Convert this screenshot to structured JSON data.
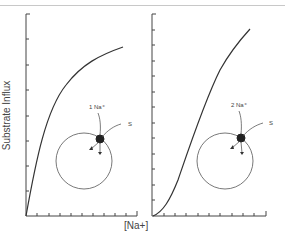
{
  "figure": {
    "ylabel": "Substrate Influx",
    "xlabel": "[Na+]",
    "panels": [
      {
        "id": "left",
        "curve_type": "hyperbolic",
        "annotation_ion": "1 Na⁺",
        "annotation_substrate": "S"
      },
      {
        "id": "right",
        "curve_type": "sigmoidal",
        "annotation_ion": "2 Na⁺",
        "annotation_substrate": "S"
      }
    ],
    "colors": {
      "line": "#333333",
      "axis": "#444444",
      "text": "#444444"
    }
  }
}
